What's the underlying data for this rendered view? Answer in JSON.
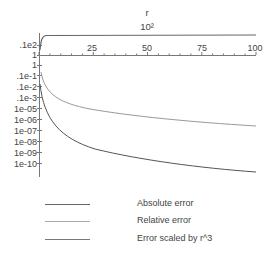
{
  "chart_data": {
    "type": "line",
    "title": "",
    "xlabel": "r",
    "xlabel_secondary": "10²",
    "ylabel": "",
    "xlim": [
      1,
      100
    ],
    "x_ticks": [
      "25",
      "50",
      "75",
      "100"
    ],
    "y_scale": "log (mixed)",
    "y_ticks": [
      ".1e2",
      "1",
      "1",
      ".1e-1",
      ".1e-2",
      ".1e-3",
      "1e-05",
      "1e-06",
      "1e-07",
      "1e-08",
      "1e-09",
      "1e-10"
    ],
    "grid": false,
    "legend_position": "bottom",
    "series": [
      {
        "name": "Absolute error",
        "color": "#555555",
        "x": [
          1,
          2,
          3,
          5,
          10,
          20,
          30,
          50,
          75,
          100
        ],
        "values": [
          0.001,
          0.000125,
          3.7e-05,
          8e-06,
          1e-06,
          1.25e-07,
          3.7e-08,
          8e-09,
          2.4e-09,
          1e-09
        ]
      },
      {
        "name": "Relative error",
        "color": "#999999",
        "x": [
          1,
          2,
          3,
          5,
          10,
          20,
          30,
          50,
          75,
          100
        ],
        "values": [
          0.1,
          0.025,
          0.011,
          0.004,
          0.001,
          0.00025,
          0.00011,
          4e-05,
          1.8e-05,
          1e-05
        ]
      },
      {
        "name": "Error scaled by r^3",
        "color": "#666666",
        "x": [
          1,
          2,
          3,
          5,
          10,
          20,
          30,
          50,
          75,
          100
        ],
        "values": [
          1,
          100,
          100,
          100,
          100,
          100,
          100,
          100,
          100,
          100
        ]
      }
    ]
  },
  "legend": {
    "items": [
      {
        "label": "Absolute error"
      },
      {
        "label": "Relative error"
      },
      {
        "label": "Error scaled by r^3"
      }
    ]
  }
}
